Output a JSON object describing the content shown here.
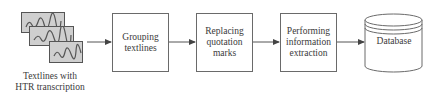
{
  "input": {
    "caption_lines": [
      "Textlines with",
      "HTR transcription"
    ],
    "icon": "handwritten-textline-images-icon"
  },
  "steps": [
    {
      "id": "grouping",
      "lines": [
        "Grouping",
        "textlines"
      ]
    },
    {
      "id": "replacing",
      "lines": [
        "Replacing",
        "quotation",
        "marks"
      ]
    },
    {
      "id": "extraction",
      "lines": [
        "Performing",
        "information",
        "extraction"
      ]
    }
  ],
  "output": {
    "label": "Database",
    "icon": "database-cylinder-icon"
  },
  "colors": {
    "stroke": "#6a6a6a",
    "card_fill": "#cfcfcf",
    "text": "#3a3a3a"
  }
}
